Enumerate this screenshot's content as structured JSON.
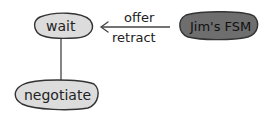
{
  "diagram": {
    "type": "state-machine",
    "nodes": [
      {
        "id": "wait",
        "label": "wait",
        "fill": "#dcdcdc"
      },
      {
        "id": "jims_fsm",
        "label": "Jim's FSM",
        "fill": "#6e6e6e"
      },
      {
        "id": "negotiate",
        "label": "negotiate",
        "fill": "#dcdcdc"
      }
    ],
    "edges": [
      {
        "from": "jims_fsm",
        "to": "wait",
        "label_top": "offer",
        "label_bottom": "retract",
        "arrow": true
      },
      {
        "from": "wait",
        "to": "negotiate",
        "arrow": false
      }
    ],
    "colors": {
      "stroke": "#333333",
      "light_fill": "#dcdcdc",
      "dark_fill": "#6e6e6e"
    }
  }
}
